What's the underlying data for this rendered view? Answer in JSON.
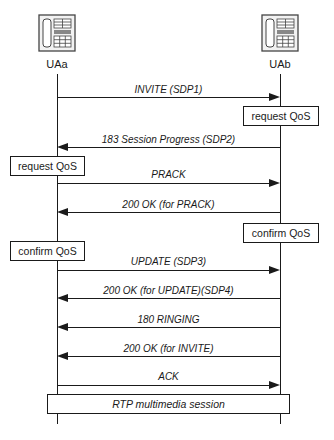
{
  "actors": [
    {
      "id": "a",
      "label": "UAa",
      "icon": "telephone-icon"
    },
    {
      "id": "b",
      "label": "UAb",
      "icon": "telephone-icon"
    }
  ],
  "messages": [
    {
      "label": "INVITE (SDP1)",
      "from": "UAa",
      "to": "UAb"
    },
    {
      "label": "183 Session Progress (SDP2)",
      "from": "UAb",
      "to": "UAa"
    },
    {
      "label": "PRACK",
      "from": "UAa",
      "to": "UAb"
    },
    {
      "label": "200 OK (for PRACK)",
      "from": "UAb",
      "to": "UAa"
    },
    {
      "label": "UPDATE (SDP3)",
      "from": "UAa",
      "to": "UAb"
    },
    {
      "label": "200 OK (for UPDATE)(SDP4)",
      "from": "UAb",
      "to": "UAa"
    },
    {
      "label": "180 RINGING",
      "from": "UAb",
      "to": "UAa"
    },
    {
      "label": "200 OK (for INVITE)",
      "from": "UAb",
      "to": "UAa"
    },
    {
      "label": "ACK",
      "from": "UAa",
      "to": "UAb"
    }
  ],
  "actions": [
    {
      "label": "request QoS",
      "at": "UAb"
    },
    {
      "label": "request QoS",
      "at": "UAa"
    },
    {
      "label": "confirm QoS",
      "at": "UAb"
    },
    {
      "label": "confirm QoS",
      "at": "UAa"
    }
  ],
  "session": {
    "label": "RTP multimedia session"
  }
}
